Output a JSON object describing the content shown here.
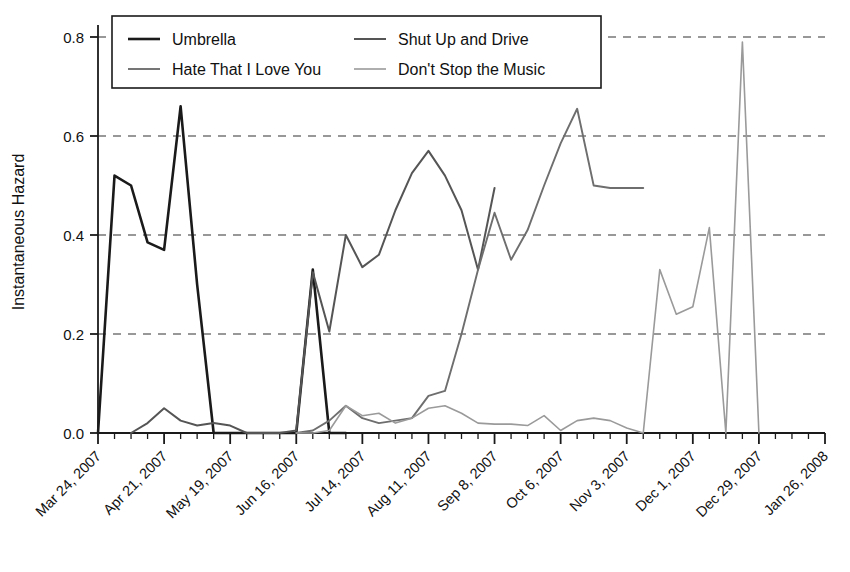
{
  "chart_data": {
    "type": "line",
    "title": "",
    "xlabel": "",
    "ylabel": "Instantaneous Hazard",
    "ylim": [
      0.0,
      0.84
    ],
    "yticks": [
      "0.0",
      "0.2",
      "0.4",
      "0.6",
      "0.8"
    ],
    "ytick_values": [
      0.0,
      0.2,
      0.4,
      0.6,
      0.8
    ],
    "grid": "horizontal-dashed",
    "legend_position": "top-center",
    "x_axis_note": "Weekly observations; labeled every 4 weeks",
    "xticks": [
      "Mar 24, 2007",
      "Apr 21, 2007",
      "May 19, 2007",
      "Jun 16, 2007",
      "Jul 14, 2007",
      "Aug 11, 2007",
      "Sep 8, 2007",
      "Oct 6, 2007",
      "Nov 3, 2007",
      "Dec 1, 2007",
      "Dec 29, 2007",
      "Jan 26, 2008"
    ],
    "xtick_week_index": [
      0,
      4,
      8,
      12,
      16,
      20,
      24,
      28,
      32,
      36,
      40,
      44
    ],
    "n_weeks": 45,
    "series": [
      {
        "name": "Umbrella",
        "color": "#1a1a1a",
        "width": 2.6,
        "start_week": 0,
        "values": [
          0.0,
          0.52,
          0.5,
          0.385,
          0.37,
          0.66,
          0.3,
          0.0,
          0.0,
          0.0,
          0.0,
          0.0,
          0.0,
          0.33,
          0.0,
          0.0
        ]
      },
      {
        "name": "Shut Up and Drive",
        "color": "#555555",
        "width": 2.0,
        "start_week": 2,
        "values": [
          0.0,
          0.02,
          0.05,
          0.025,
          0.015,
          0.02,
          0.015,
          0.0,
          0.0,
          0.0,
          0.005,
          0.325,
          0.205,
          0.4,
          0.335,
          0.36,
          0.45,
          0.525,
          0.57,
          0.52,
          0.45,
          0.33,
          0.495
        ]
      },
      {
        "name": "Hate That I Love You",
        "color": "#6e6e6e",
        "width": 1.9,
        "start_week": 12,
        "values": [
          0.0,
          0.005,
          0.025,
          0.055,
          0.03,
          0.02,
          0.025,
          0.03,
          0.075,
          0.085,
          0.2,
          0.33,
          0.445,
          0.35,
          0.41,
          0.5,
          0.585,
          0.655,
          0.5,
          0.495,
          0.495,
          0.495
        ]
      },
      {
        "name": "Don't Stop the Music",
        "color": "#9a9a9a",
        "width": 1.6,
        "start_week": 12,
        "values": [
          0.0,
          0.0,
          0.005,
          0.055,
          0.035,
          0.04,
          0.02,
          0.03,
          0.05,
          0.055,
          0.04,
          0.02,
          0.018,
          0.018,
          0.015,
          0.035,
          0.005,
          0.025,
          0.03,
          0.025,
          0.01,
          0.0,
          0.33,
          0.24,
          0.255,
          0.415,
          0.0,
          0.79,
          0.0
        ]
      }
    ],
    "legend": [
      {
        "label": "Umbrella",
        "color": "#1a1a1a",
        "width": 2.6
      },
      {
        "label": "Shut Up and Drive",
        "color": "#555555",
        "width": 2.0
      },
      {
        "label": "Hate That I Love You",
        "color": "#6e6e6e",
        "width": 1.9
      },
      {
        "label": "Don't Stop the Music",
        "color": "#9a9a9a",
        "width": 1.6
      }
    ]
  }
}
